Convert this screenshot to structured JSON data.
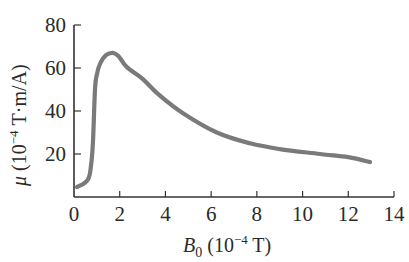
{
  "chart_data": {
    "type": "line",
    "title": "",
    "xlabel": "B0 (10^-4 T)",
    "ylabel": "μ (10^-4 T·m/A)",
    "xlabel_parts": {
      "symbol": "B",
      "subscript": "0",
      "unit_prefix": "(10",
      "exponent": "−4",
      "unit_suffix": " T)"
    },
    "ylabel_parts": {
      "symbol": "μ",
      "unit_prefix": "(10",
      "exponent": "−4",
      "unit_suffix": " T·m/A)"
    },
    "xlim": [
      0,
      14
    ],
    "ylim": [
      0,
      80
    ],
    "x_ticks": [
      0,
      2,
      4,
      6,
      8,
      10,
      12,
      14
    ],
    "y_ticks": [
      20,
      40,
      60,
      80
    ],
    "grid": false,
    "legend": null,
    "line_color": "#7a7a7a",
    "series": [
      {
        "name": "μ vs B0",
        "x": [
          0.13,
          0.6,
          0.75,
          0.83,
          0.92,
          1.0,
          1.14,
          1.4,
          1.7,
          1.95,
          2.3,
          3.0,
          3.67,
          4.77,
          6.25,
          7.7,
          9.0,
          10.76,
          12.0,
          12.95
        ],
        "values": [
          4.6,
          8,
          15,
          26,
          50,
          57,
          62,
          66,
          67,
          65.5,
          60.5,
          55,
          48,
          39,
          30,
          25,
          22.3,
          20,
          18.5,
          16.3
        ]
      }
    ]
  },
  "labels": {
    "x_tick_labels": [
      "0",
      "2",
      "4",
      "6",
      "8",
      "10",
      "12",
      "14"
    ],
    "y_tick_labels": [
      "20",
      "40",
      "60",
      "80"
    ]
  }
}
